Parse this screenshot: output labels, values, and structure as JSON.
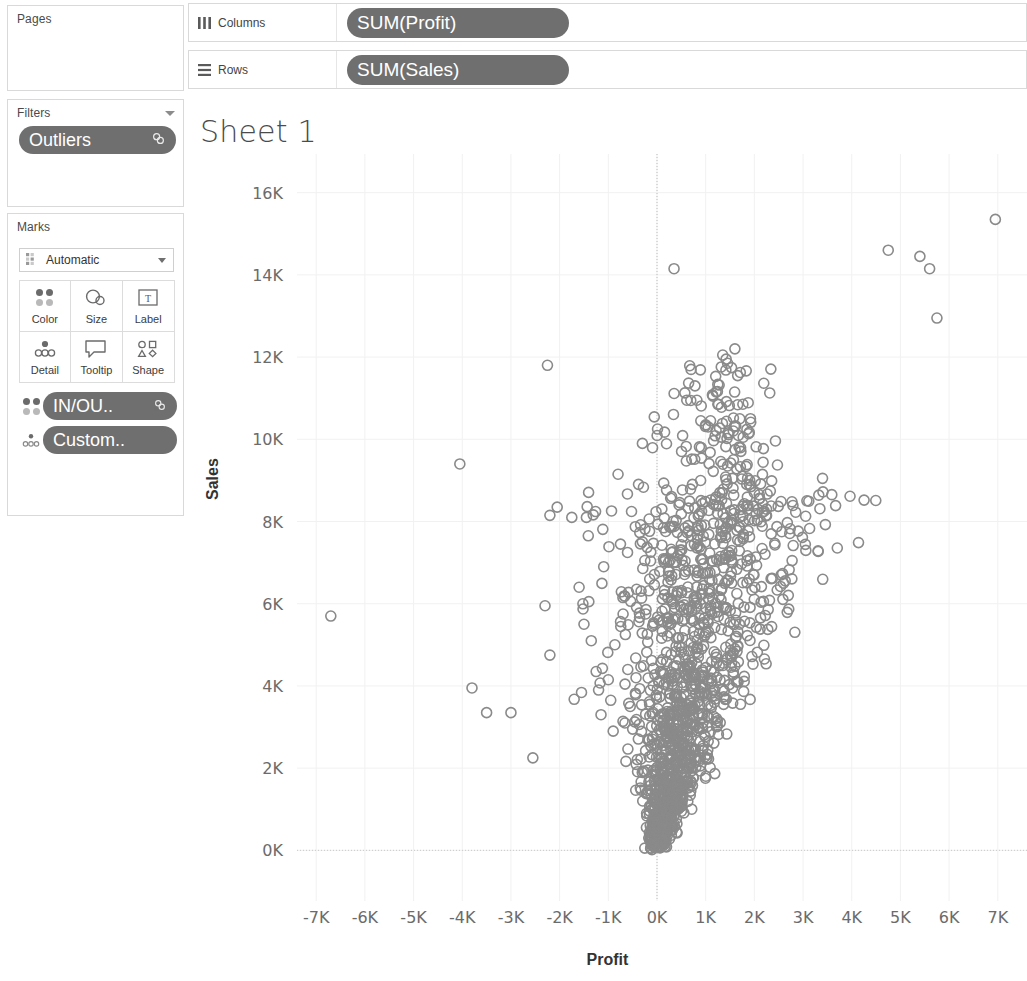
{
  "app": "Tableau",
  "shelves": {
    "pages": {
      "title": "Pages"
    },
    "filters": {
      "title": "Filters",
      "pill": "Outliers",
      "pill_end_icon": "filter-link-icon"
    },
    "columns": {
      "label": "Columns",
      "icon": "columns-icon",
      "pill": "SUM(Profit)"
    },
    "rows": {
      "label": "Rows",
      "icon": "rows-icon",
      "pill": "SUM(Sales)"
    }
  },
  "marks": {
    "title": "Marks",
    "type": "Automatic",
    "type_icon": "automatic-marks-icon",
    "buttons": [
      {
        "label": "Color",
        "icon": "color-icon"
      },
      {
        "label": "Size",
        "icon": "size-icon"
      },
      {
        "label": "Label",
        "icon": "label-icon"
      },
      {
        "label": "Detail",
        "icon": "detail-icon"
      },
      {
        "label": "Tooltip",
        "icon": "tooltip-icon"
      },
      {
        "label": "Shape",
        "icon": "shape-icon"
      }
    ],
    "pills": [
      {
        "label": "IN/OU..",
        "icon": "color-icon",
        "end_icon": "calculation-icon"
      },
      {
        "label": "Custom..",
        "icon": "detail-icon",
        "end_icon": ""
      }
    ]
  },
  "sheet": {
    "title": "Sheet 1"
  },
  "chart_data": {
    "type": "scatter",
    "title": "Sheet 1",
    "xlabel": "Profit",
    "ylabel": "Sales",
    "xlim": [
      -7600,
      7600
    ],
    "ylim": [
      -600,
      16600
    ],
    "xticks": [
      -7000,
      -6000,
      -5000,
      -4000,
      -3000,
      -2000,
      -1000,
      0,
      1000,
      2000,
      3000,
      4000,
      5000,
      6000,
      7000
    ],
    "xtick_labels": [
      "-7K",
      "-6K",
      "-5K",
      "-4K",
      "-3K",
      "-2K",
      "-1K",
      "0K",
      "1K",
      "2K",
      "3K",
      "4K",
      "5K",
      "6K",
      "7K"
    ],
    "yticks": [
      0,
      2000,
      4000,
      6000,
      8000,
      10000,
      12000,
      14000,
      16000
    ],
    "ytick_labels": [
      "0K",
      "2K",
      "4K",
      "6K",
      "8K",
      "10K",
      "12K",
      "14K",
      "16K"
    ],
    "grid": true,
    "zero_reference_line_x": 0,
    "legend": null,
    "marker": {
      "shape": "circle-open",
      "color": "#8a8a8a",
      "size": 10,
      "stroke_width": 1.6
    },
    "outlier_points": [
      [
        -6700,
        5700
      ],
      [
        -4050,
        9400
      ],
      [
        -3800,
        3950
      ],
      [
        -3500,
        3350
      ],
      [
        -3000,
        3350
      ],
      [
        -2550,
        2250
      ],
      [
        -2250,
        11800
      ],
      [
        -2200,
        8150
      ],
      [
        -2050,
        8350
      ],
      [
        -2300,
        5950
      ],
      [
        -2200,
        4750
      ],
      [
        -1750,
        8100
      ],
      [
        -1450,
        8100
      ],
      [
        -1600,
        6400
      ],
      [
        -1500,
        5500
      ],
      [
        -1400,
        6050
      ],
      [
        -1350,
        5100
      ],
      [
        -1250,
        4350
      ],
      [
        -1200,
        3900
      ],
      [
        -1150,
        3300
      ],
      [
        -1000,
        4150
      ],
      [
        -950,
        3650
      ],
      [
        -900,
        2900
      ],
      [
        -800,
        9150
      ],
      [
        -750,
        7450
      ],
      [
        -700,
        6150
      ],
      [
        -650,
        5250
      ],
      [
        -600,
        4400
      ],
      [
        -550,
        3500
      ],
      [
        -500,
        2950
      ],
      [
        -300,
        9900
      ],
      [
        -250,
        7050
      ],
      [
        -150,
        6600
      ],
      [
        350,
        14150
      ],
      [
        700,
        11700
      ],
      [
        780,
        11300
      ],
      [
        820,
        10950
      ],
      [
        900,
        10450
      ],
      [
        1000,
        10350
      ],
      [
        1050,
        10300
      ],
      [
        1100,
        10450
      ],
      [
        1150,
        11050
      ],
      [
        1250,
        10850
      ],
      [
        1350,
        12050
      ],
      [
        1420,
        11950
      ],
      [
        1450,
        11850
      ],
      [
        1600,
        12200
      ],
      [
        1700,
        10500
      ],
      [
        1450,
        9350
      ],
      [
        1550,
        9050
      ],
      [
        1750,
        9100
      ],
      [
        1900,
        8900
      ],
      [
        2000,
        8700
      ],
      [
        2100,
        8650
      ],
      [
        2200,
        8250
      ],
      [
        2250,
        8300
      ],
      [
        2550,
        6700
      ],
      [
        2600,
        6500
      ],
      [
        3400,
        9050
      ],
      [
        4750,
        14600
      ],
      [
        5400,
        14450
      ],
      [
        5600,
        14150
      ],
      [
        5750,
        12950
      ],
      [
        6950,
        15350
      ]
    ],
    "cluster_description": "Dense funnel-shaped cluster of ~1200 marks rising from (0K, 0K) and fanning out toward positive profit; bulk of points between -1K and 2K profit and 0K-8K sales"
  }
}
